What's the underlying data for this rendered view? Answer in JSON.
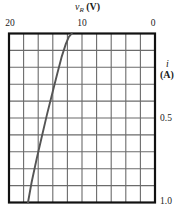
{
  "figure": {
    "name": "zener-reverse-characteristic-graph"
  },
  "axes": {
    "top": {
      "symbol": "v",
      "subscript": "R",
      "unit": "(V)",
      "label": "v_R (V)",
      "ticks": [
        "20",
        "10",
        "0"
      ],
      "tick_values": [
        20,
        10,
        0
      ],
      "range": [
        20,
        0
      ],
      "reversed": true
    },
    "right": {
      "symbol": "i",
      "unit": "(A)",
      "label": "i (A)",
      "ticks": [
        "0.5",
        "1.0"
      ],
      "tick_values": [
        0.5,
        1.0
      ],
      "range": [
        0,
        1.0
      ],
      "reversed": true
    }
  },
  "chart_data": {
    "type": "line",
    "title": "",
    "subtitle": "",
    "xlabel": "v_R (V)",
    "ylabel": "i (A)",
    "xlim": [
      20,
      0
    ],
    "ylim": [
      0,
      1.0
    ],
    "x_ticks": [
      20,
      10,
      0
    ],
    "x_tick_labels": [
      "20",
      "10",
      "0"
    ],
    "y_ticks": [
      0.5,
      1.0
    ],
    "y_tick_labels": [
      "0.5",
      "1.0"
    ],
    "x_axis_position": "top",
    "y_axis_position": "right",
    "x_axis_reversed": true,
    "y_axis_reversed": true,
    "grid": true,
    "grid_columns": 10,
    "grid_rows": 10,
    "legend": null,
    "annotations": [],
    "series": [
      {
        "name": "Zener reverse breakdown characteristic",
        "color": "#555555",
        "x": [
          11.4,
          11.8,
          12.2,
          12.8,
          13.4,
          14.1,
          14.8,
          15.5,
          16.2,
          16.9,
          17.4
        ],
        "y": [
          0.0,
          0.02,
          0.06,
          0.14,
          0.24,
          0.36,
          0.48,
          0.61,
          0.74,
          0.88,
          1.0
        ]
      }
    ]
  },
  "style": {
    "frame_color": "#111111",
    "grid_color": "#6b6b6b",
    "curve_color": "#555555",
    "background": "#ffffff"
  }
}
